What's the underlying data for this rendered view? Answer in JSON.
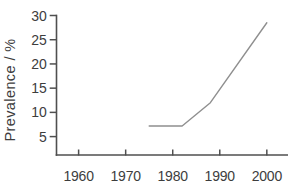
{
  "canvas": {
    "width": 305,
    "height": 193,
    "background": "#ffffff"
  },
  "chart_data": {
    "type": "line",
    "title": "",
    "xlabel": "",
    "ylabel": "Prevalence / %",
    "x_ticks": [
      1960,
      1970,
      1980,
      1990,
      2000
    ],
    "y_ticks": [
      5,
      10,
      15,
      20,
      25,
      30
    ],
    "xlim": [
      1955.3,
      2004.5
    ],
    "ylim": [
      1.2,
      30
    ],
    "grid": false,
    "legend": false,
    "series": [
      {
        "name": "Prevalence",
        "points": [
          [
            1975,
            7.2
          ],
          [
            1982,
            7.2
          ],
          [
            1988,
            12
          ],
          [
            2000,
            28.5
          ]
        ],
        "color": "#8f8f8f"
      }
    ],
    "axis_color": "#4f4f4f",
    "text_color": "#3d3d3d"
  }
}
